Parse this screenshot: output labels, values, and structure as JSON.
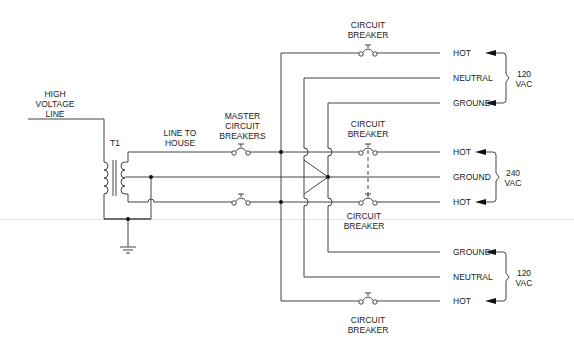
{
  "diagram": {
    "source_labels": {
      "high_voltage_line": [
        "HIGH",
        "VOLTAGE",
        "LINE"
      ],
      "transformer": "T1",
      "line_to_house": [
        "LINE TO",
        "HOUSE"
      ],
      "master_breakers": [
        "MASTER",
        "CIRCUIT",
        "BREAKERS"
      ]
    },
    "breaker_label": [
      "CIRCUIT",
      "BREAKER"
    ],
    "circuits": [
      {
        "name": "top-120v",
        "voltage": [
          "120",
          "VAC"
        ],
        "conductors": [
          "HOT",
          "NEUTRAL",
          "GROUND"
        ]
      },
      {
        "name": "middle-240v",
        "voltage": [
          "240",
          "VAC"
        ],
        "conductors": [
          "HOT",
          "GROUND",
          "HOT"
        ]
      },
      {
        "name": "bottom-120v",
        "voltage": [
          "120",
          "VAC"
        ],
        "conductors": [
          "GROUND",
          "NEUTRAL",
          "HOT"
        ]
      }
    ],
    "colors": {
      "line": "#333333",
      "text": "#222222"
    }
  }
}
